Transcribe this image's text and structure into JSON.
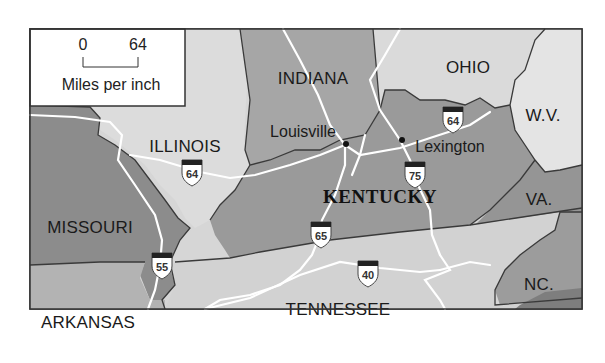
{
  "legend": {
    "scale_start": "0",
    "scale_end": "64",
    "units": "Miles per inch"
  },
  "states": {
    "indiana": "INDIANA",
    "ohio": "OHIO",
    "illinois": "ILLINOIS",
    "wv": "W.V.",
    "kentucky": "KENTUCKY",
    "va": "VA.",
    "missouri": "MISSOURI",
    "nc": "NC.",
    "tennessee": "TENNESSEE",
    "arkansas": "ARKANSAS"
  },
  "cities": {
    "louisville": "Louisville",
    "lexington": "Lexington"
  },
  "interstates": {
    "i64_west": "64",
    "i64_east": "64",
    "i75": "75",
    "i65": "65",
    "i55": "55",
    "i40": "40"
  },
  "colors": {
    "dark_state": "#8a8a8a",
    "mid_state": "#a9a9a9",
    "light_state": "#d9d9d9",
    "lightest_state": "#e6e6e6",
    "border": "#333333",
    "road": "#ffffff"
  }
}
